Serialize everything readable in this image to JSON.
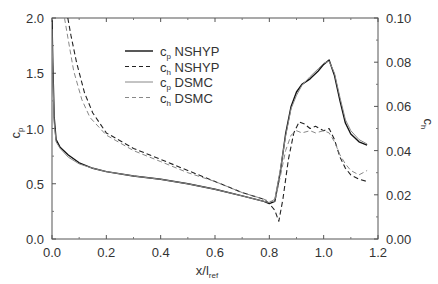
{
  "chart_data": {
    "type": "line",
    "title": "",
    "xlabel": "x/l_ref",
    "xlabel_main": "x/l",
    "xlabel_sub": "ref",
    "ylabel_left": "c_p",
    "ylabel_left_main": "c",
    "ylabel_left_sub": "p",
    "ylabel_right": "c_h",
    "ylabel_right_main": "c",
    "ylabel_right_sub": "h",
    "xlim": [
      0.0,
      1.2
    ],
    "ylim_left": [
      0.0,
      2.0
    ],
    "ylim_right": [
      0.0,
      0.1
    ],
    "xticks": [
      "0.0",
      "0.2",
      "0.4",
      "0.6",
      "0.8",
      "1.0",
      "1.2"
    ],
    "yticks_left": [
      "0.0",
      "0.5",
      "1.0",
      "1.5",
      "2.0"
    ],
    "yticks_right": [
      "0.00",
      "0.02",
      "0.04",
      "0.06",
      "0.08",
      "0.10"
    ],
    "grid": false,
    "legend_position": "upper-left-inside",
    "series": [
      {
        "name": "c_p NSHYP",
        "label_main": "c",
        "label_sub": "p",
        "label_rest": " NSHYP",
        "axis": "left",
        "style": "solid",
        "color": "#111111",
        "width": 1.4,
        "x": [
          0.0,
          0.003,
          0.008,
          0.015,
          0.03,
          0.06,
          0.1,
          0.15,
          0.2,
          0.3,
          0.4,
          0.5,
          0.6,
          0.7,
          0.78,
          0.8,
          0.82,
          0.84,
          0.86,
          0.88,
          0.9,
          0.92,
          0.95,
          0.98,
          1.0,
          1.02,
          1.04,
          1.06,
          1.08,
          1.1,
          1.13,
          1.16
        ],
        "y": [
          1.98,
          1.6,
          1.1,
          0.9,
          0.83,
          0.76,
          0.69,
          0.64,
          0.61,
          0.57,
          0.54,
          0.5,
          0.45,
          0.39,
          0.34,
          0.32,
          0.34,
          0.6,
          0.95,
          1.2,
          1.33,
          1.4,
          1.45,
          1.52,
          1.58,
          1.62,
          1.48,
          1.25,
          1.05,
          0.95,
          0.88,
          0.85
        ]
      },
      {
        "name": "c_h NSHYP",
        "label_main": "c",
        "label_sub": "h",
        "label_rest": " NSHYP",
        "axis": "right",
        "style": "dashed",
        "color": "#222222",
        "width": 1.1,
        "x": [
          0.058,
          0.07,
          0.09,
          0.12,
          0.15,
          0.2,
          0.3,
          0.4,
          0.5,
          0.6,
          0.7,
          0.78,
          0.8,
          0.82,
          0.835,
          0.85,
          0.87,
          0.89,
          0.91,
          0.93,
          0.95,
          0.97,
          1.0,
          1.02,
          1.04,
          1.06,
          1.08,
          1.1,
          1.13,
          1.16
        ],
        "y": [
          0.1,
          0.092,
          0.08,
          0.066,
          0.057,
          0.048,
          0.041,
          0.036,
          0.031,
          0.026,
          0.021,
          0.018,
          0.016,
          0.013,
          0.008,
          0.018,
          0.036,
          0.048,
          0.053,
          0.052,
          0.05,
          0.051,
          0.049,
          0.05,
          0.045,
          0.037,
          0.032,
          0.029,
          0.027,
          0.026
        ]
      },
      {
        "name": "c_p DSMC",
        "label_main": "c",
        "label_sub": "p",
        "label_rest": " DSMC",
        "axis": "left",
        "style": "solid",
        "color": "#888888",
        "width": 1.0,
        "x": [
          0.0,
          0.003,
          0.008,
          0.015,
          0.03,
          0.06,
          0.1,
          0.15,
          0.2,
          0.3,
          0.4,
          0.5,
          0.6,
          0.7,
          0.78,
          0.8,
          0.82,
          0.84,
          0.86,
          0.88,
          0.9,
          0.92,
          0.95,
          0.98,
          1.0,
          1.02,
          1.04,
          1.06,
          1.08,
          1.1,
          1.13,
          1.16
        ],
        "y": [
          1.9,
          1.5,
          1.05,
          0.88,
          0.82,
          0.74,
          0.68,
          0.64,
          0.61,
          0.57,
          0.54,
          0.5,
          0.45,
          0.39,
          0.34,
          0.33,
          0.36,
          0.62,
          0.93,
          1.18,
          1.3,
          1.39,
          1.47,
          1.54,
          1.59,
          1.61,
          1.5,
          1.28,
          1.08,
          0.98,
          0.9,
          0.86
        ]
      },
      {
        "name": "c_h DSMC",
        "label_main": "c",
        "label_sub": "h",
        "label_rest": " DSMC",
        "axis": "right",
        "style": "dashed",
        "color": "#888888",
        "width": 1.0,
        "x": [
          0.046,
          0.06,
          0.08,
          0.11,
          0.14,
          0.2,
          0.3,
          0.4,
          0.5,
          0.6,
          0.7,
          0.78,
          0.8,
          0.82,
          0.84,
          0.86,
          0.88,
          0.9,
          0.92,
          0.95,
          0.97,
          1.0,
          1.02,
          1.04,
          1.06,
          1.08,
          1.1,
          1.13,
          1.16
        ],
        "y": [
          0.1,
          0.09,
          0.076,
          0.063,
          0.055,
          0.047,
          0.04,
          0.035,
          0.03,
          0.026,
          0.021,
          0.018,
          0.017,
          0.017,
          0.028,
          0.04,
          0.047,
          0.049,
          0.048,
          0.049,
          0.048,
          0.049,
          0.048,
          0.044,
          0.038,
          0.034,
          0.031,
          0.029,
          0.031
        ]
      }
    ]
  }
}
